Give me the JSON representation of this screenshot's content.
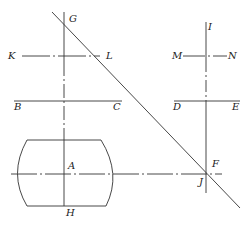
{
  "diagram": {
    "type": "geometric-construction",
    "line_color": "#333333",
    "labels": {
      "G": "G",
      "K": "K",
      "L": "L",
      "B": "B",
      "C": "C",
      "I": "I",
      "M": "M",
      "N": "N",
      "D": "D",
      "E": "E",
      "A": "A",
      "H": "H",
      "F": "F",
      "J": "J"
    },
    "lines": [
      {
        "name": "GH",
        "style": "dash-dot",
        "orientation": "vertical"
      },
      {
        "name": "KL",
        "style": "dash-dot",
        "orientation": "horizontal"
      },
      {
        "name": "BC",
        "style": "solid",
        "orientation": "horizontal"
      },
      {
        "name": "IJ",
        "style": "dash-dot",
        "orientation": "vertical"
      },
      {
        "name": "MN",
        "style": "dash-dot",
        "orientation": "horizontal"
      },
      {
        "name": "DE",
        "style": "solid",
        "orientation": "horizontal"
      },
      {
        "name": "AF",
        "style": "dash-dot",
        "orientation": "horizontal"
      },
      {
        "name": "diagonal-GF",
        "style": "solid",
        "orientation": "diagonal"
      }
    ],
    "shapes": [
      {
        "name": "barrel-outline",
        "style": "solid",
        "center": "A"
      }
    ]
  }
}
